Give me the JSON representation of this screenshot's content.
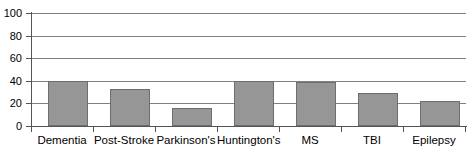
{
  "chart_data": {
    "type": "bar",
    "title": "",
    "subtitle": "",
    "xlabel": "",
    "ylabel": "",
    "categories": [
      "Dementia",
      "Post-Stroke",
      "Parkinson's",
      "Huntington's",
      "MS",
      "TBI",
      "Epilepsy"
    ],
    "values": [
      40,
      33,
      16,
      40,
      39,
      29,
      22
    ],
    "ylim": [
      0,
      100
    ],
    "ytick_labels": [
      "0",
      "20",
      "40",
      "60",
      "80",
      "100"
    ],
    "ytick_values": [
      0,
      20,
      40,
      60,
      80,
      100
    ],
    "grid": true,
    "legend": false,
    "legend_position": "none",
    "series": [
      {
        "name": "",
        "values": [
          40,
          33,
          16,
          40,
          39,
          29,
          22
        ]
      }
    ],
    "colors": {
      "bar_fill": "#969696",
      "bar_border": "#6e6e6e",
      "gridline": "#808080",
      "axis": "#555555",
      "background": "#ffffff",
      "text": "#000000"
    }
  }
}
